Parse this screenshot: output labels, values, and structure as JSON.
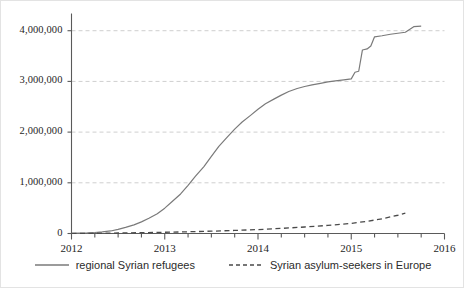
{
  "chart_data": {
    "type": "line",
    "title": "",
    "xlabel": "",
    "ylabel": "",
    "xlim": [
      2012.0,
      2016.0
    ],
    "ylim": [
      0,
      4300000
    ],
    "grid": true,
    "grid_axis": "y",
    "legend_position": "bottom",
    "y_ticks": [
      0,
      1000000,
      2000000,
      3000000,
      4000000
    ],
    "y_tick_labels": [
      "0",
      "1,000,000",
      "2,000,000",
      "3,000,000",
      "4,000,000"
    ],
    "x_ticks": [
      2012,
      2013,
      2014,
      2015,
      2016
    ],
    "x_tick_labels": [
      "2012",
      "2013",
      "2014",
      "2015",
      "2016"
    ],
    "x_minor_tick_interval": 0.25,
    "series": [
      {
        "name": "regional Syrian refugees",
        "style": "solid",
        "color": "#7a7a7a",
        "x": [
          2012.0,
          2012.08,
          2012.17,
          2012.25,
          2012.33,
          2012.42,
          2012.5,
          2012.58,
          2012.67,
          2012.75,
          2012.83,
          2012.92,
          2013.0,
          2013.08,
          2013.17,
          2013.25,
          2013.33,
          2013.42,
          2013.5,
          2013.58,
          2013.67,
          2013.75,
          2013.83,
          2013.92,
          2014.0,
          2014.08,
          2014.17,
          2014.25,
          2014.33,
          2014.42,
          2014.5,
          2014.58,
          2014.67,
          2014.75,
          2014.83,
          2014.92,
          2015.0,
          2015.04,
          2015.08,
          2015.12,
          2015.17,
          2015.21,
          2015.25,
          2015.33,
          2015.42,
          2015.5,
          2015.58,
          2015.67,
          2015.75
        ],
        "y": [
          5000,
          8000,
          12000,
          20000,
          32000,
          50000,
          80000,
          120000,
          170000,
          230000,
          300000,
          390000,
          500000,
          630000,
          780000,
          950000,
          1130000,
          1320000,
          1520000,
          1720000,
          1900000,
          2060000,
          2200000,
          2330000,
          2450000,
          2560000,
          2650000,
          2730000,
          2800000,
          2860000,
          2900000,
          2930000,
          2960000,
          2990000,
          3010000,
          3030000,
          3050000,
          3180000,
          3200000,
          3620000,
          3640000,
          3700000,
          3880000,
          3900000,
          3930000,
          3950000,
          3970000,
          4080000,
          4090000
        ]
      },
      {
        "name": "Syrian asylum-seekers in Europe",
        "style": "dashed",
        "color": "#4a4a4a",
        "x": [
          2012.0,
          2012.25,
          2012.5,
          2012.75,
          2013.0,
          2013.25,
          2013.5,
          2013.75,
          2014.0,
          2014.25,
          2014.5,
          2014.75,
          2015.0,
          2015.17,
          2015.33,
          2015.5,
          2015.58
        ],
        "y": [
          2000,
          5000,
          10000,
          16000,
          24000,
          34000,
          46000,
          60000,
          78000,
          100000,
          128000,
          160000,
          200000,
          240000,
          290000,
          360000,
          400000
        ]
      }
    ]
  },
  "legend": {
    "entries": [
      {
        "label": "regional Syrian refugees",
        "style": "solid"
      },
      {
        "label": "Syrian asylum-seekers in Europe",
        "style": "dashed"
      }
    ]
  },
  "colors": {
    "background": "#ffffff",
    "axis": "#5a5a5a",
    "grid": "#cfcfcf",
    "frame": "#e3e3e3",
    "text": "#262626",
    "series_solid": "#7a7a7a",
    "series_dashed": "#4a4a4a"
  }
}
